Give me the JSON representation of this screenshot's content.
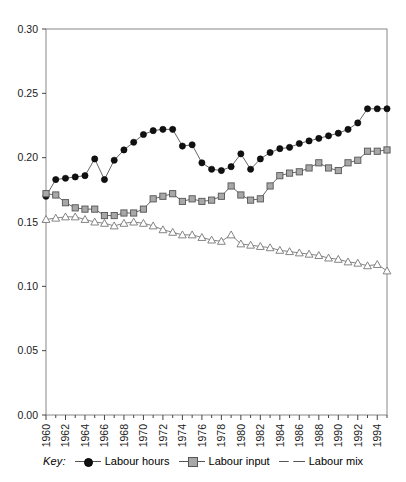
{
  "chart_data": {
    "type": "line",
    "title": "",
    "xlabel": "",
    "ylabel": "",
    "xlim": [
      1960,
      1995
    ],
    "ylim": [
      0.0,
      0.3
    ],
    "ytick_labels": [
      "0.00",
      "0.05",
      "0.10",
      "0.15",
      "0.20",
      "0.25",
      "0.30"
    ],
    "ytick_values": [
      0.0,
      0.05,
      0.1,
      0.15,
      0.2,
      0.25,
      0.3
    ],
    "xtick_labels": [
      "1960",
      "1962",
      "1964",
      "1966",
      "1968",
      "1970",
      "1972",
      "1974",
      "1976",
      "1978",
      "1980",
      "1982",
      "1984",
      "1986",
      "1988",
      "1990",
      "1992",
      "1994"
    ],
    "xtick_values": [
      1960,
      1962,
      1964,
      1966,
      1968,
      1970,
      1972,
      1974,
      1976,
      1978,
      1980,
      1982,
      1984,
      1986,
      1988,
      1990,
      1992,
      1994
    ],
    "minor_xticks_every": 1,
    "grid": false,
    "legend_position": "below-axis",
    "x": [
      1960,
      1961,
      1962,
      1963,
      1964,
      1965,
      1966,
      1967,
      1968,
      1969,
      1970,
      1971,
      1972,
      1973,
      1974,
      1975,
      1976,
      1977,
      1978,
      1979,
      1980,
      1981,
      1982,
      1983,
      1984,
      1985,
      1986,
      1987,
      1988,
      1989,
      1990,
      1991,
      1992,
      1993,
      1994,
      1995
    ],
    "series": [
      {
        "name": "Labour hours",
        "marker": "circle-filled",
        "color": "#111111",
        "line_color": "#555555",
        "values": [
          0.17,
          0.183,
          0.184,
          0.185,
          0.186,
          0.199,
          0.183,
          0.198,
          0.206,
          0.212,
          0.218,
          0.221,
          0.222,
          0.222,
          0.209,
          0.21,
          0.196,
          0.191,
          0.19,
          0.193,
          0.203,
          0.191,
          0.199,
          0.204,
          0.207,
          0.208,
          0.211,
          0.213,
          0.215,
          0.217,
          0.219,
          0.222,
          0.227,
          0.238,
          0.238,
          0.238
        ]
      },
      {
        "name": "Labour input",
        "marker": "square",
        "color": "#a8a8a8",
        "line_color": "#555555",
        "values": [
          0.172,
          0.171,
          0.165,
          0.161,
          0.16,
          0.16,
          0.155,
          0.155,
          0.157,
          0.157,
          0.16,
          0.168,
          0.17,
          0.172,
          0.166,
          0.168,
          0.166,
          0.167,
          0.17,
          0.178,
          0.171,
          0.167,
          0.168,
          0.178,
          0.186,
          0.188,
          0.189,
          0.192,
          0.196,
          0.192,
          0.19,
          0.196,
          0.198,
          0.205,
          0.205,
          0.206
        ]
      },
      {
        "name": "Labour mix",
        "marker": "triangle-open",
        "color": "#ffffff",
        "line_color": "#777777",
        "values": [
          0.152,
          0.153,
          0.154,
          0.154,
          0.152,
          0.15,
          0.149,
          0.147,
          0.149,
          0.15,
          0.149,
          0.147,
          0.144,
          0.142,
          0.14,
          0.14,
          0.138,
          0.136,
          0.135,
          0.14,
          0.133,
          0.132,
          0.131,
          0.13,
          0.128,
          0.127,
          0.126,
          0.125,
          0.124,
          0.122,
          0.121,
          0.119,
          0.118,
          0.116,
          0.117,
          0.112
        ]
      }
    ]
  },
  "legend": {
    "key_word": "Key:",
    "entries": [
      {
        "label": "Labour hours",
        "marker": "circle-filled"
      },
      {
        "label": "Labour input",
        "marker": "square"
      },
      {
        "label": "Labour mix",
        "marker": "triangle-open"
      }
    ]
  }
}
